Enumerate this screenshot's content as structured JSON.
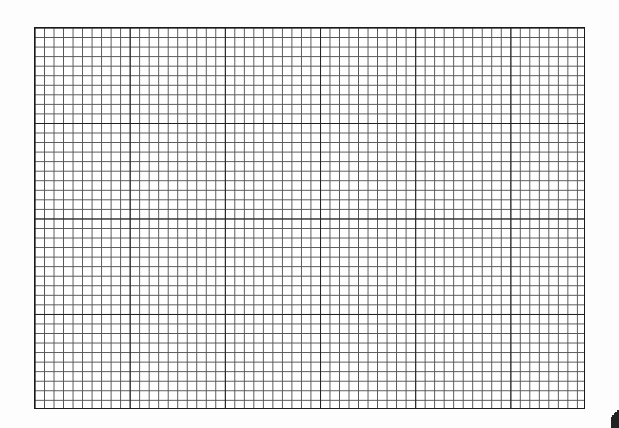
{
  "page": {
    "type": "graph-paper"
  },
  "grid": {
    "major_columns": 6,
    "major_rows": 4,
    "minor_per_major": 10,
    "line_color": "#222222",
    "minor_line_color": "#555555",
    "background_color": "#ffffff"
  }
}
